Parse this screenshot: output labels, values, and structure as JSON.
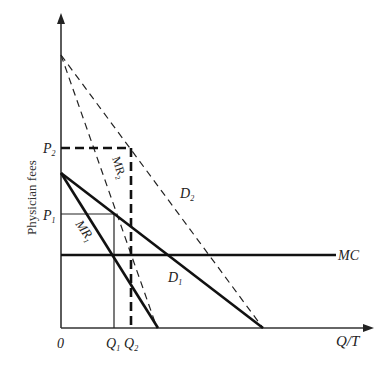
{
  "diagram": {
    "y_axis_label": "Physician fees",
    "x_axis_label": "Q/T",
    "origin_label": "0",
    "price_labels": {
      "p2": "P",
      "p2_sub": "2",
      "p1": "P",
      "p1_sub": "1"
    },
    "quantity_labels": {
      "q1": "Q",
      "q1_sub": "1",
      "q2": "Q",
      "q2_sub": "2"
    },
    "curves": {
      "mc": "MC",
      "d1": "D",
      "d1_sub": "1",
      "d2": "D",
      "d2_sub": "2",
      "mr1": "MR",
      "mr1_sub": "1",
      "mr2": "MR",
      "mr2_sub": "2"
    },
    "colors": {
      "line": "#111111",
      "axis": "#333333"
    }
  }
}
